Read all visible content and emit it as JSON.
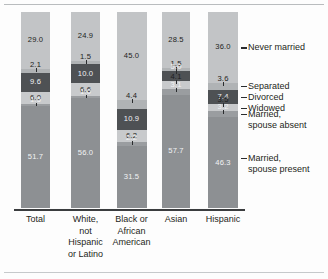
{
  "chart_data": {
    "type": "bar",
    "subtype": "stacked-bar-100",
    "title": "",
    "subtitle": "",
    "xlabel": "",
    "ylabel": "",
    "ylim": [
      0,
      100
    ],
    "grid": false,
    "legend_position": "right",
    "categories": [
      "Total",
      "White,\nnot\nHispanic\nor Latino",
      "Black or\nAfrican\nAmerican",
      "Asian",
      "Hispanic"
    ],
    "series": [
      {
        "name": "Never married",
        "color": "#c2c4c6",
        "values": [
          29.0,
          24.9,
          45.0,
          28.5,
          36.0
        ]
      },
      {
        "name": "Separated",
        "color": "#b0b3b5",
        "values": [
          2.1,
          1.5,
          4.4,
          1.5,
          3.6
        ]
      },
      {
        "name": "Divorced",
        "color": "#4e5154",
        "values": [
          9.6,
          10.0,
          10.9,
          5.0,
          7.4
        ]
      },
      {
        "name": "Widowed",
        "color": "#c8cacc",
        "values": [
          6.0,
          6.6,
          6.2,
          4.1,
          3.5
        ]
      },
      {
        "name": "Married,\nspouse absent",
        "color": "#9a9da0",
        "values": [
          1.5,
          1.0,
          2.2,
          3.1,
          3.2
        ]
      },
      {
        "name": "Married,\nspouse present",
        "color": "#8d9093",
        "values": [
          51.7,
          56.0,
          31.5,
          57.7,
          46.3
        ]
      }
    ]
  },
  "legend": {
    "items": [
      {
        "label": "Never married"
      },
      {
        "label": "Separated"
      },
      {
        "label": "Divorced"
      },
      {
        "label": "Widowed"
      },
      {
        "label": "Married,\nspouse absent"
      },
      {
        "label": "Married,\nspouse present"
      }
    ]
  },
  "axis": {
    "tick_labels": [
      "Total",
      "White,\nnot\nHispanic\nor Latino",
      "Black or\nAfrican\nAmerican",
      "Asian",
      "Hispanic"
    ]
  }
}
